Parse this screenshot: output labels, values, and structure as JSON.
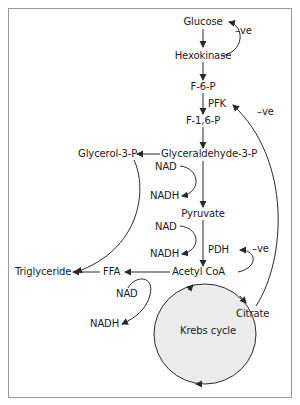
{
  "diagram": {
    "nodes": {
      "glucose": "Glucose",
      "hexokinase": "Hexokinase",
      "f6p": "F-6-P",
      "pfk": "PFK",
      "f16p": "F-1,6-P",
      "glyceraldehyde3p": "Glyceraldehyde-3-P",
      "glycerol3p": "Glycerol-3-P",
      "nad1": "NAD",
      "nadh1": "NADH",
      "pyruvate": "Pyruvate",
      "nad2": "NAD",
      "nadh2": "NADH",
      "pdh": "PDH",
      "acetylcoa": "Acetyl CoA",
      "triglyceride": "Triglyceride",
      "ffa": "FFA",
      "nad3": "NAD",
      "nadh3": "NADH",
      "citrate": "Citrate",
      "krebs": "Krebs cycle"
    },
    "feedback": {
      "hexokinase_ve": "–ve",
      "pfk_ve": "–ve",
      "pdh_ve": "–ve"
    },
    "colors": {
      "line": "#2a2a2a",
      "frame": "#9a9a9a",
      "krebs_fill": "#ececec"
    }
  }
}
